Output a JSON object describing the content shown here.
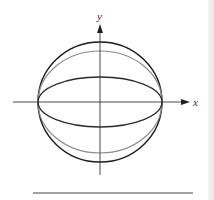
{
  "diagram": {
    "axes": {
      "x_label": "x",
      "y_label": "y"
    },
    "curves": [
      {
        "name": "circle",
        "kind": "circle",
        "color": "#1a1a1a",
        "rx": 62,
        "ry": 60
      },
      {
        "name": "middle-ellipse",
        "kind": "ellipse",
        "color": "#8a8a8a",
        "rx": 62,
        "ry": 51
      },
      {
        "name": "inner-ellipse",
        "kind": "ellipse",
        "color": "#2a2a2a",
        "rx": 62,
        "ry": 25
      }
    ],
    "colors": {
      "axis": "#333333",
      "rule": "#444444",
      "background": "#ffffff"
    }
  }
}
